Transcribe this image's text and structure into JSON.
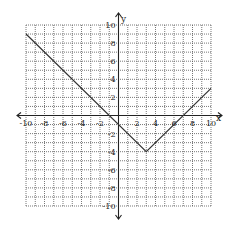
{
  "chart_data": {
    "type": "line",
    "title": "",
    "xlabel": "x",
    "ylabel": "y",
    "xlim": [
      -10,
      10
    ],
    "ylim": [
      -10,
      10
    ],
    "grid": true,
    "grid_style": "dotted",
    "x_ticks": [
      -10,
      -8,
      -6,
      -4,
      -2,
      2,
      4,
      6,
      8,
      10
    ],
    "y_ticks": [
      10,
      8,
      6,
      4,
      2,
      -2,
      -4,
      -6,
      -8,
      -10
    ],
    "x_tick_labels": [
      "-10",
      "-8",
      "-6",
      "-4",
      "-2",
      "2",
      "4",
      "6",
      "8",
      "10"
    ],
    "y_tick_labels": [
      "10",
      "8",
      "6",
      "4",
      "2",
      "-2",
      "-4",
      "-6",
      "-8",
      "-10"
    ],
    "series": [
      {
        "name": "y = |x - 3| - 4",
        "points": [
          [
            -10,
            9
          ],
          [
            3,
            -4
          ],
          [
            10,
            3
          ]
        ]
      }
    ],
    "colors": {
      "line": "#333333",
      "axis": "#222222",
      "grid": "#555555"
    }
  }
}
